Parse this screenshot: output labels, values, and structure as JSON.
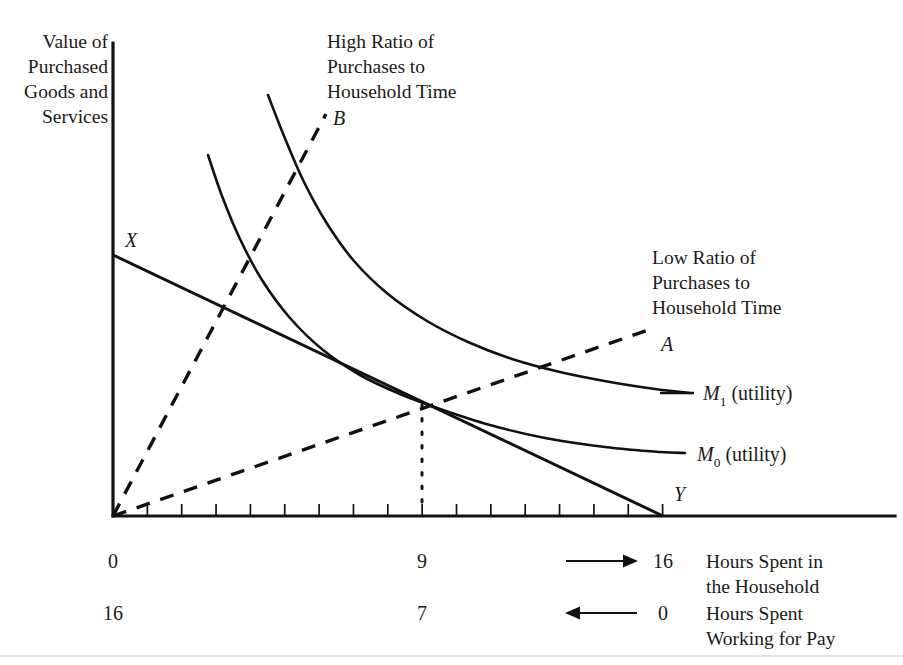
{
  "figure": {
    "width": 903,
    "height": 665,
    "background": "#ffffff",
    "ink_color": "#111111",
    "rule_color": "#d8d8dc"
  },
  "axes": {
    "y_axis_label_lines": [
      "Value of",
      "Purchased",
      "Goods and",
      "Services"
    ],
    "origin_px": {
      "x": 113,
      "y": 516
    },
    "y_axis_top_px": 43,
    "x_axis_right_px": 895,
    "tick_count": 16,
    "tick_spacing_px": 34.35,
    "tick_length_px": 12,
    "household_axis": {
      "title_lines": [
        "Hours Spent in",
        "the Household"
      ],
      "arrow_direction": "right",
      "tick_labels": [
        {
          "value": "0",
          "x_px": 113
        },
        {
          "value": "9",
          "x_px": 422
        },
        {
          "value": "16",
          "x_px": 663
        }
      ]
    },
    "work_axis": {
      "title_lines": [
        "Hours Spent",
        "Working for Pay"
      ],
      "arrow_direction": "left",
      "tick_labels": [
        {
          "value": "16",
          "x_px": 113
        },
        {
          "value": "7",
          "x_px": 422
        },
        {
          "value": "0",
          "x_px": 663
        }
      ]
    }
  },
  "annotations": {
    "high_ratio": {
      "lines": [
        "High Ratio of",
        "Purchases to",
        "Household Time"
      ],
      "x_px": 327,
      "y_px": 48
    },
    "low_ratio": {
      "lines": [
        "Low Ratio of",
        "Purchases to",
        "Household Time"
      ],
      "x_px": 652,
      "y_px": 264
    }
  },
  "point_labels": [
    {
      "name": "X",
      "text": "X",
      "x_px": 125,
      "y_px": 247
    },
    {
      "name": "Y",
      "text": "Y",
      "x_px": 674,
      "y_px": 501
    },
    {
      "name": "A",
      "text": "A",
      "x_px": 661,
      "y_px": 351
    },
    {
      "name": "B",
      "text": "B",
      "x_px": 333,
      "y_px": 125
    }
  ],
  "curve_labels": [
    {
      "name": "M1",
      "symbol": "M",
      "subscript": "1",
      "suffix": " (utility)",
      "x_px": 703,
      "y_px": 400,
      "leader": {
        "x1": 660,
        "y1": 393,
        "x2": 694,
        "y2": 393
      }
    },
    {
      "name": "M0",
      "symbol": "M",
      "subscript": "0",
      "suffix": " (utility)",
      "x_px": 697,
      "y_px": 461,
      "leader": null
    }
  ],
  "chart_data": {
    "type": "line",
    "title": "",
    "xlabel": "Hours Spent in the Household",
    "ylabel": "Value of Purchased Goods and Services",
    "xlim": [
      0,
      16
    ],
    "grid": false,
    "legend": "inline-labels",
    "tangency_point": {
      "x": 9,
      "label": "9",
      "px": {
        "x": 422,
        "y": 403
      }
    },
    "series": [
      {
        "name": "M0 (utility)",
        "style": "solid",
        "kind": "indifference-curve",
        "points_px": [
          [
            208,
            155
          ],
          [
            222,
            196
          ],
          [
            240,
            239
          ],
          [
            262,
            280
          ],
          [
            290,
            318
          ],
          [
            323,
            350
          ],
          [
            360,
            375
          ],
          [
            400,
            394
          ],
          [
            440,
            409
          ],
          [
            490,
            425
          ],
          [
            545,
            438
          ],
          [
            605,
            447
          ],
          [
            660,
            452
          ],
          [
            685,
            453
          ]
        ]
      },
      {
        "name": "M1 (utility)",
        "style": "solid",
        "kind": "indifference-curve",
        "points_px": [
          [
            268,
            95
          ],
          [
            284,
            136
          ],
          [
            303,
            180
          ],
          [
            326,
            222
          ],
          [
            354,
            261
          ],
          [
            388,
            294
          ],
          [
            427,
            321
          ],
          [
            468,
            342
          ],
          [
            512,
            359
          ],
          [
            560,
            372
          ],
          [
            610,
            382
          ],
          [
            655,
            389
          ],
          [
            690,
            393
          ]
        ]
      },
      {
        "name": "XY budget line",
        "style": "solid",
        "kind": "budget-constraint",
        "points_px": [
          [
            113,
            255
          ],
          [
            663,
            516
          ]
        ]
      },
      {
        "name": "Ray A (low ratio)",
        "style": "dashed",
        "kind": "ratio-ray",
        "points_px": [
          [
            113,
            516
          ],
          [
            648,
            330
          ]
        ]
      },
      {
        "name": "Ray B (high ratio)",
        "style": "dashed",
        "kind": "ratio-ray",
        "points_px": [
          [
            113,
            516
          ],
          [
            326,
            114
          ]
        ]
      },
      {
        "name": "Tangency drop line",
        "style": "dotted",
        "kind": "guide",
        "points_px": [
          [
            422,
            405
          ],
          [
            422,
            512
          ]
        ]
      }
    ]
  }
}
